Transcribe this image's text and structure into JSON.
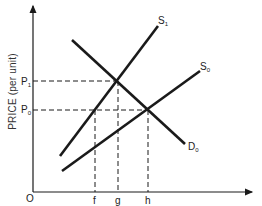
{
  "diagram": {
    "type": "supply-demand",
    "y_axis_label": "PRICE (per unit)",
    "origin_label": "O",
    "price_labels": {
      "p1": "P",
      "p1_sub": "1",
      "p0": "P",
      "p0_sub": "0"
    },
    "quantity_labels": {
      "f": "f",
      "g": "g",
      "h": "h"
    },
    "curves": {
      "s1": {
        "label": "S",
        "sub": "1"
      },
      "s0": {
        "label": "S",
        "sub": "0"
      },
      "d0": {
        "label": "D",
        "sub": "0"
      }
    },
    "line_color": "#1a1a1a"
  }
}
